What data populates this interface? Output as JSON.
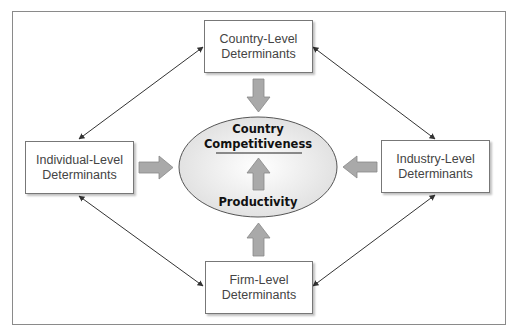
{
  "diagram": {
    "center": {
      "title_line1": "Country",
      "title_line2": "Competitiveness",
      "bottom_label": "Productivity"
    },
    "nodes": [
      {
        "id": "country",
        "line1": "Country-Level",
        "line2": "Determinants"
      },
      {
        "id": "individual",
        "line1": "Individual-Level",
        "line2": "Determinants"
      },
      {
        "id": "industry",
        "line1": "Industry-Level",
        "line2": "Determinants"
      },
      {
        "id": "firm",
        "line1": "Firm-Level",
        "line2": "Determinants"
      }
    ],
    "edges": [
      {
        "from": "individual",
        "to": "country",
        "type": "bidirectional"
      },
      {
        "from": "country",
        "to": "industry",
        "type": "bidirectional"
      },
      {
        "from": "individual",
        "to": "firm",
        "type": "bidirectional"
      },
      {
        "from": "firm",
        "to": "industry",
        "type": "bidirectional"
      },
      {
        "from": "country",
        "to": "center",
        "type": "block-arrow"
      },
      {
        "from": "individual",
        "to": "center",
        "type": "block-arrow"
      },
      {
        "from": "industry",
        "to": "center",
        "type": "block-arrow"
      },
      {
        "from": "firm",
        "to": "center",
        "type": "block-arrow"
      },
      {
        "from": "productivity",
        "to": "competitiveness",
        "type": "block-arrow"
      }
    ],
    "colors": {
      "block_arrow": "#a9a9a9",
      "ellipse_fill": "#ececec",
      "line": "#333333"
    }
  }
}
